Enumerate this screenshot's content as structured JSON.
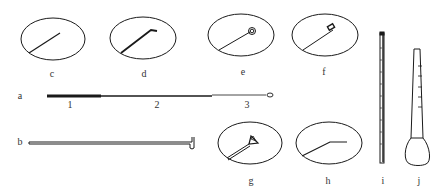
{
  "figure": {
    "colors": {
      "stroke": "#1a1a1a",
      "background": "#ffffff"
    }
  },
  "labels": {
    "c": "c",
    "d": "d",
    "e": "e",
    "f": "f",
    "a": "a",
    "a1": "1",
    "a2": "2",
    "a3": "3",
    "b": "b",
    "g": "g",
    "h": "h",
    "i": "i",
    "j": "j"
  },
  "items": [
    {
      "id": "a",
      "shape": "inoculating-loop-full",
      "parts": [
        "1",
        "2",
        "3"
      ]
    },
    {
      "id": "b",
      "shape": "hooked-rod"
    },
    {
      "id": "c",
      "shape": "straight-needle"
    },
    {
      "id": "d",
      "shape": "bent-tip-needle"
    },
    {
      "id": "e",
      "shape": "coiled-loop"
    },
    {
      "id": "f",
      "shape": "square-loop"
    },
    {
      "id": "g",
      "shape": "triangle-loop"
    },
    {
      "id": "h",
      "shape": "angled-needle"
    },
    {
      "id": "i",
      "shape": "graduated-pipette"
    },
    {
      "id": "j",
      "shape": "bulb-dropper"
    }
  ]
}
